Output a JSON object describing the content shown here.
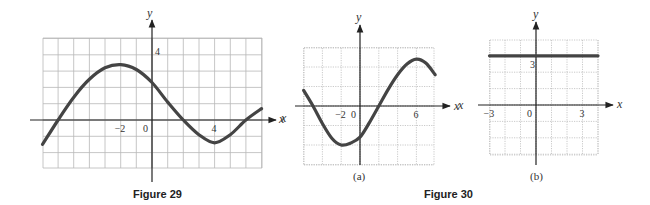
{
  "chart_data": [
    {
      "id": "fig29",
      "type": "line",
      "title": "Figure 29",
      "xlabel": "x",
      "ylabel": "y",
      "xlim": [
        -7,
        7
      ],
      "ylim": [
        -3,
        5
      ],
      "grid": true,
      "x_tick_labels": [
        {
          "value": -2,
          "label": "−2"
        },
        {
          "value": 0,
          "label": "0"
        },
        {
          "value": 4,
          "label": "4"
        }
      ],
      "y_tick_labels": [
        {
          "value": 4,
          "label": "4"
        }
      ],
      "series": [
        {
          "name": "f",
          "x": [
            -7,
            -6,
            -5,
            -4,
            -3,
            -2,
            -1,
            0,
            1,
            2,
            3,
            4,
            5,
            6,
            7
          ],
          "y": [
            -1.5,
            0,
            1.4,
            2.5,
            3.2,
            3.4,
            3.1,
            2.3,
            1.1,
            0,
            -0.9,
            -1.4,
            -0.9,
            0,
            0.7
          ]
        }
      ],
      "layout": {
        "px_left": 43,
        "px_right": 262,
        "px_top": 38,
        "px_bottom": 168,
        "origin_x": 152,
        "origin_y": 120,
        "unit_x": 15.65,
        "unit_y": 16.3
      }
    },
    {
      "id": "fig30a",
      "type": "line",
      "title": "(a)",
      "xlabel": "x",
      "ylabel": "y",
      "xlim": [
        -6,
        8
      ],
      "ylim": [
        -6,
        6
      ],
      "grid": true,
      "grid_style": "dotted",
      "x_tick_labels": [
        {
          "value": -2,
          "label": "−2"
        },
        {
          "value": 0,
          "label": "0"
        },
        {
          "value": 6,
          "label": "6"
        }
      ],
      "y_tick_labels": [],
      "series": [
        {
          "name": "f",
          "x": [
            -6,
            -5,
            -4,
            -3,
            -2,
            -1,
            0,
            1,
            2,
            3,
            4,
            5,
            6,
            7,
            8
          ],
          "y": [
            1.6,
            0,
            -1.8,
            -3.3,
            -4,
            -3.8,
            -3.2,
            -1.7,
            0,
            1.7,
            3.2,
            4.3,
            4.8,
            4.4,
            3.2
          ]
        }
      ],
      "layout": {
        "px_left": 304,
        "px_right": 434,
        "px_top": 48,
        "px_bottom": 165,
        "origin_x": 360,
        "origin_y": 106,
        "unit_x": 9.4,
        "unit_y": 9.75
      }
    },
    {
      "id": "fig30b",
      "type": "line",
      "title": "(b)",
      "xlabel": "x",
      "ylabel": "y",
      "xlim": [
        -3,
        4
      ],
      "ylim": [
        -3,
        4
      ],
      "grid": true,
      "grid_style": "dotted",
      "x_tick_labels": [
        {
          "value": -3,
          "label": "−3"
        },
        {
          "value": 0,
          "label": "0"
        },
        {
          "value": 3,
          "label": "3"
        }
      ],
      "y_tick_labels": [
        {
          "value": 3,
          "label": "3"
        }
      ],
      "series": [
        {
          "name": "f",
          "x": [
            -3,
            4
          ],
          "y": [
            3,
            3
          ]
        }
      ],
      "layout": {
        "px_left": 490,
        "px_right": 598,
        "px_top": 40,
        "px_bottom": 155,
        "origin_x": 536,
        "origin_y": 105,
        "unit_x": 15.5,
        "unit_y": 16.4
      }
    }
  ],
  "captions": {
    "figure29": "Figure 29",
    "figure30": "Figure 30",
    "panel_a": "(a)",
    "panel_b": "(b)"
  },
  "axis_labels": {
    "x": "x",
    "y": "y"
  },
  "colors": {
    "curve": "#444444",
    "grid": "#b8b8b8",
    "axis": "#222222"
  }
}
